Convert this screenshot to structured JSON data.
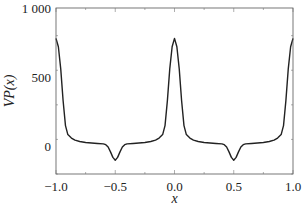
{
  "chart_data": {
    "type": "line",
    "title": "",
    "xlabel": "x",
    "ylabel": "VP(x)",
    "xlim": [
      -1.0,
      1.0
    ],
    "ylim": [
      -200,
      1000
    ],
    "xticks": [
      -1.0,
      -0.5,
      0.0,
      0.5,
      1.0
    ],
    "xtick_labels": [
      "−1.0",
      "−0.5",
      "0.0",
      "0.5",
      "1.0"
    ],
    "yticks": [
      0,
      500,
      1000
    ],
    "ytick_labels": [
      "0",
      "500",
      "1 000"
    ],
    "grid": false,
    "legend": null,
    "series": [
      {
        "name": "VP(x)",
        "color": "#222222",
        "x": [
          -1.0,
          -0.98,
          -0.96,
          -0.94,
          -0.92,
          -0.9,
          -0.87,
          -0.84,
          -0.8,
          -0.75,
          -0.7,
          -0.65,
          -0.6,
          -0.58,
          -0.56,
          -0.54,
          -0.52,
          -0.5,
          -0.48,
          -0.46,
          -0.44,
          -0.42,
          -0.4,
          -0.35,
          -0.3,
          -0.25,
          -0.2,
          -0.16,
          -0.13,
          -0.1,
          -0.08,
          -0.06,
          -0.04,
          -0.02,
          0.0,
          0.02,
          0.04,
          0.06,
          0.08,
          0.1,
          0.13,
          0.16,
          0.2,
          0.25,
          0.3,
          0.35,
          0.4,
          0.42,
          0.44,
          0.46,
          0.48,
          0.5,
          0.52,
          0.54,
          0.56,
          0.58,
          0.6,
          0.65,
          0.7,
          0.75,
          0.8,
          0.84,
          0.87,
          0.9,
          0.92,
          0.94,
          0.96,
          0.98,
          1.0
        ],
        "values": [
          780,
          720,
          560,
          330,
          150,
          85,
          60,
          45,
          35,
          28,
          24,
          21,
          18,
          12,
          -5,
          -40,
          -80,
          -100,
          -80,
          -40,
          -5,
          12,
          18,
          21,
          24,
          28,
          35,
          45,
          60,
          85,
          150,
          330,
          560,
          720,
          780,
          720,
          560,
          330,
          150,
          85,
          60,
          45,
          35,
          28,
          24,
          21,
          18,
          12,
          -5,
          -40,
          -80,
          -100,
          -80,
          -40,
          -5,
          12,
          18,
          21,
          24,
          28,
          35,
          45,
          60,
          85,
          150,
          330,
          560,
          720,
          780
        ]
      }
    ]
  }
}
